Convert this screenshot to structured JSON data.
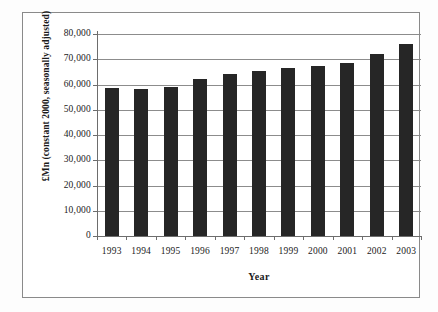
{
  "chart_data": {
    "type": "bar",
    "title": "",
    "xlabel": "Year",
    "ylabel": "£Mn (constant 2000, seasonally adjusted)",
    "categories": [
      "1993",
      "1994",
      "1995",
      "1996",
      "1997",
      "1998",
      "1999",
      "2000",
      "2001",
      "2002",
      "2003"
    ],
    "values": [
      58600,
      58300,
      59100,
      62000,
      64200,
      65300,
      66700,
      67200,
      68600,
      72000,
      76000
    ],
    "ylim": [
      0,
      80000
    ],
    "ytick_values": [
      0,
      10000,
      20000,
      30000,
      40000,
      50000,
      60000,
      70000,
      80000
    ],
    "ytick_labels": [
      "0",
      "10,000",
      "20,000",
      "30,000",
      "40,000",
      "50,000",
      "60,000",
      "70,000",
      "80,000"
    ],
    "grid": "horizontal",
    "legend": "none",
    "series": [
      {
        "name": "£Mn (constant 2000, seasonally adjusted)",
        "color": "#262626",
        "values": [
          58600,
          58300,
          59100,
          62000,
          64200,
          65300,
          66700,
          67200,
          68600,
          72000,
          76000
        ]
      }
    ]
  },
  "colors": {
    "bar": "#262626",
    "gridline": "#8c8c8c",
    "axis": "#6d6d6d",
    "frame": "#8a8a8a",
    "background": "#ffffff",
    "text": "#1a1a1a"
  }
}
